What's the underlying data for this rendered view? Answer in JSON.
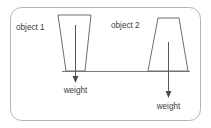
{
  "figure": {
    "frame": {
      "shape": "rounded-rectangle",
      "stroke_color": "#b0b0b0",
      "fill_color": "#ffffff"
    },
    "background_color": "#ffffff",
    "line_color": "#6e6e6e",
    "text_color": "#3d3d3d",
    "objects": [
      {
        "id": "object-1",
        "label": "object 1",
        "shape": "inverted-trapezoid",
        "description": "wider at top, narrower at base"
      },
      {
        "id": "object-2",
        "label": "object 2",
        "shape": "trapezoid",
        "description": "narrower at top, wider at base"
      }
    ],
    "forces": [
      {
        "id": "weight-1",
        "label": "weight",
        "direction": "down",
        "belongs_to": "object 1"
      },
      {
        "id": "weight-2",
        "label": "weight",
        "direction": "down",
        "belongs_to": "object 2"
      }
    ],
    "ground": {
      "label": "ground line"
    }
  }
}
